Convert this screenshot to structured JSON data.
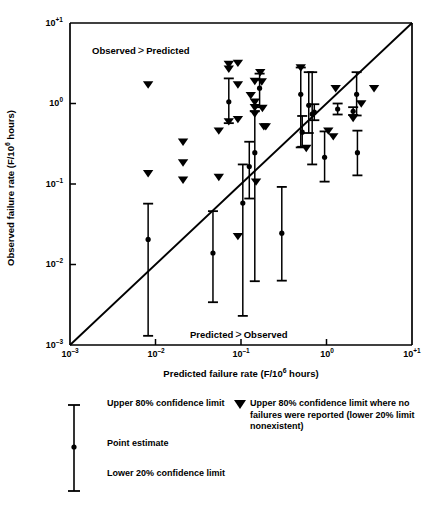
{
  "chart_data": {
    "type": "scatter",
    "title": "",
    "xlabel": "Predicted failure rate (F/10⁶ hours)",
    "ylabel": "Observed failure rate (F/10⁶ hours)",
    "xscale": "log",
    "yscale": "log",
    "xlim": [
      0.001,
      10
    ],
    "ylim": [
      0.001,
      10
    ],
    "grid": false,
    "xticks": [
      {
        "value": 0.001,
        "label": "10",
        "exp": "–3"
      },
      {
        "value": 0.01,
        "label": "10",
        "exp": "–2"
      },
      {
        "value": 0.1,
        "label": "10",
        "exp": "–1"
      },
      {
        "value": 1,
        "label": "10",
        "exp": "0"
      },
      {
        "value": 10,
        "label": "10",
        "exp": "+1"
      }
    ],
    "yticks": [
      {
        "value": 10,
        "label": "10",
        "exp": "+1"
      },
      {
        "value": 1,
        "label": "10",
        "exp": "0"
      },
      {
        "value": 0.1,
        "label": "10",
        "exp": "–1"
      },
      {
        "value": 0.01,
        "label": "10",
        "exp": "–2"
      },
      {
        "value": 0.001,
        "label": "10",
        "exp": "–3"
      }
    ],
    "reference_line": {
      "name": "identity-line",
      "from": [
        0.001,
        0.001
      ],
      "to": [
        10,
        10
      ],
      "description": "Observed equals predicted (1:1 line)"
    },
    "annotations": [
      {
        "text": "Observed",
        "comparator": ">",
        "text2": "Predicted",
        "region": "upper-left"
      },
      {
        "text": "Predicted",
        "comparator": ">",
        "text2": "Observed",
        "region": "lower-right"
      }
    ],
    "series": [
      {
        "name": "Point estimate with 80% / 20% confidence limits",
        "marker": "circle-with-error-bar",
        "points": [
          {
            "x": 0.0082,
            "y": 0.0205,
            "ylow": 0.0013,
            "yhigh": 0.057
          },
          {
            "x": 0.047,
            "y": 0.0139,
            "ylow": 0.0034,
            "yhigh": 0.046
          },
          {
            "x": 0.072,
            "y": 1.05,
            "ylow": 0.57,
            "yhigh": 2.05
          },
          {
            "x": 0.105,
            "y": 0.058,
            "ylow": 0.0023,
            "yhigh": 0.175
          },
          {
            "x": 0.125,
            "y": 0.165,
            "ylow": 0.066,
            "yhigh": 0.335
          },
          {
            "x": 0.145,
            "y": 0.245,
            "ylow": 0.0062,
            "yhigh": 0.8
          },
          {
            "x": 0.165,
            "y": 1.55,
            "ylow": 0.9,
            "yhigh": 2.35
          },
          {
            "x": 0.3,
            "y": 0.0245,
            "ylow": 0.0063,
            "yhigh": 0.092
          },
          {
            "x": 0.5,
            "y": 1.3,
            "ylow": 0.285,
            "yhigh": 2.8
          },
          {
            "x": 0.52,
            "y": 0.44,
            "ylow": 0.29,
            "yhigh": 0.7
          },
          {
            "x": 0.62,
            "y": 0.95,
            "ylow": 0.43,
            "yhigh": 2.45
          },
          {
            "x": 0.68,
            "y": 0.74,
            "ylow": 0.175,
            "yhigh": 2.45
          },
          {
            "x": 0.72,
            "y": 0.78,
            "ylow": 0.62,
            "yhigh": 0.98
          },
          {
            "x": 0.95,
            "y": 0.215,
            "ylow": 0.107,
            "yhigh": 0.45
          },
          {
            "x": 1.35,
            "y": 0.855,
            "ylow": 0.73,
            "yhigh": 1.0
          },
          {
            "x": 2.05,
            "y": 0.8,
            "ylow": 0.72,
            "yhigh": 0.9
          },
          {
            "x": 2.25,
            "y": 1.3,
            "ylow": 0.71,
            "yhigh": 2.45
          },
          {
            "x": 2.3,
            "y": 0.245,
            "ylow": 0.128,
            "yhigh": 0.46
          }
        ]
      },
      {
        "name": "Upper 80% confidence limit where no failures were reported",
        "marker": "down-triangle",
        "points": [
          {
            "x": 0.0082,
            "y": 1.72
          },
          {
            "x": 0.0082,
            "y": 0.136
          },
          {
            "x": 0.021,
            "y": 0.335
          },
          {
            "x": 0.021,
            "y": 0.185
          },
          {
            "x": 0.021,
            "y": 0.113
          },
          {
            "x": 0.055,
            "y": 0.46
          },
          {
            "x": 0.055,
            "y": 0.122
          },
          {
            "x": 0.072,
            "y": 3.1
          },
          {
            "x": 0.072,
            "y": 2.7
          },
          {
            "x": 0.072,
            "y": 0.6
          },
          {
            "x": 0.092,
            "y": 3.2
          },
          {
            "x": 0.092,
            "y": 1.72
          },
          {
            "x": 0.092,
            "y": 0.64
          },
          {
            "x": 0.092,
            "y": 0.0225
          },
          {
            "x": 0.13,
            "y": 1.27
          },
          {
            "x": 0.145,
            "y": 1.9
          },
          {
            "x": 0.145,
            "y": 1.05
          },
          {
            "x": 0.145,
            "y": 0.9
          },
          {
            "x": 0.145,
            "y": 0.75
          },
          {
            "x": 0.15,
            "y": 0.107
          },
          {
            "x": 0.168,
            "y": 2.45
          },
          {
            "x": 0.175,
            "y": 1.88
          },
          {
            "x": 0.178,
            "y": 0.88
          },
          {
            "x": 0.185,
            "y": 0.52
          },
          {
            "x": 0.195,
            "y": 0.52
          },
          {
            "x": 0.5,
            "y": 2.8
          },
          {
            "x": 0.58,
            "y": 0.28
          },
          {
            "x": 1.05,
            "y": 0.46
          },
          {
            "x": 1.2,
            "y": 0.39
          },
          {
            "x": 1.28,
            "y": 1.55
          },
          {
            "x": 2.05,
            "y": 0.66
          },
          {
            "x": 2.55,
            "y": 1.0
          },
          {
            "x": 3.6,
            "y": 1.55
          }
        ]
      }
    ]
  },
  "legend": {
    "upper_limit": "Upper 80% confidence limit",
    "point_estimate": "Point estimate",
    "lower_limit": "Lower 20% confidence limit",
    "triangle_note": "Upper 80% confidence limit where no failures were reported (lower 20% limit nonexistent)"
  },
  "annotations": {
    "observed_gt_predicted_a": "Observed",
    "observed_gt_predicted_op": ">",
    "observed_gt_predicted_b": "Predicted",
    "predicted_gt_observed_a": "Predicted",
    "predicted_gt_observed_op": ">",
    "predicted_gt_observed_b": "Observed"
  },
  "colors": {
    "ink": "#000000",
    "background": "#ffffff"
  }
}
